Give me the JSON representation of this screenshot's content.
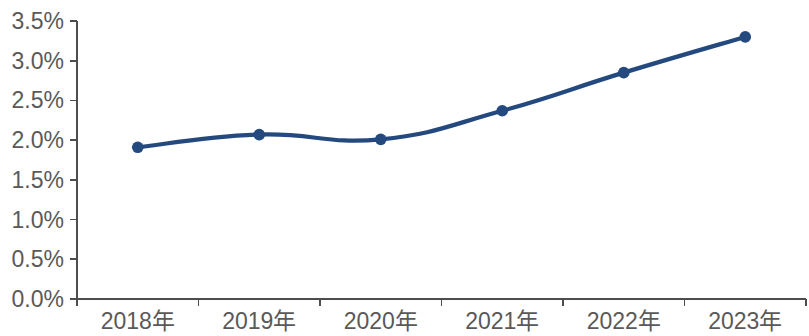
{
  "chart_data": {
    "type": "line",
    "title": "",
    "subtitle": "",
    "xlabel": "",
    "ylabel": "",
    "categories": [
      "2018年",
      "2019年",
      "2020年",
      "2021年",
      "2022年",
      "2023年"
    ],
    "series": [
      {
        "name": "",
        "values": [
          1.91,
          2.07,
          2.01,
          2.37,
          2.85,
          3.3
        ],
        "color": "#23497F",
        "marker": "circle",
        "smooth": true
      }
    ],
    "ylim": [
      0.0,
      3.5
    ],
    "ytick_values": [
      0.0,
      0.5,
      1.0,
      1.5,
      2.0,
      2.5,
      3.0,
      3.5
    ],
    "ytick_labels": [
      "0.0%",
      "0.5%",
      "1.0%",
      "1.5%",
      "2.0%",
      "2.5%",
      "3.0%",
      "3.5%"
    ],
    "xtick_labels": [
      "2018年",
      "2019年",
      "2020年",
      "2021年",
      "2022年",
      "2023年"
    ],
    "grid": false,
    "legend": false,
    "legend_position": "none",
    "annotations": [],
    "axis_color": "#4D4D4D",
    "tick_label_color": "#595959",
    "plot_background": "#FFFFFF"
  }
}
